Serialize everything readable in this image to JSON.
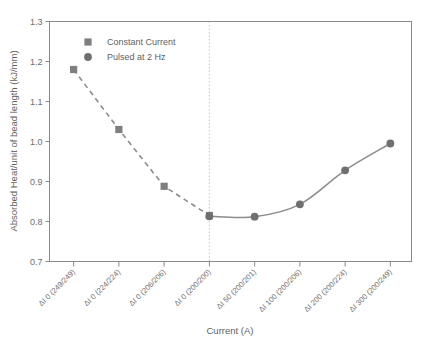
{
  "chart_data": {
    "type": "scatter",
    "title": "",
    "xlabel": "Current (A)",
    "ylabel": "Absorbed Heat/unit of bead length  (kJ/mm)",
    "categories": [
      "ΔI 0 (249/249)",
      "ΔI 0 (224/224)",
      "ΔI 0 (206/206)",
      "ΔI 0 (200/200)",
      "ΔI 50 (200/201)",
      "ΔI 100 (200/206)",
      "ΔI 200 (200/224)",
      "ΔI 300 (200/249)"
    ],
    "ylim": [
      0.7,
      1.3
    ],
    "yticks": [
      "0.7",
      "0.8",
      "0.9",
      "1.0",
      "1.1",
      "1.2",
      "1.3"
    ],
    "ytick_values": [
      0.7,
      0.8,
      0.9,
      1.0,
      1.1,
      1.2,
      1.3
    ],
    "grid": false,
    "legend_position": "top-left-inside",
    "series": [
      {
        "name": "Constant Current",
        "marker": "square",
        "linestyle": "dashed",
        "color": "#7f7f7f",
        "x": [
          0,
          1,
          2,
          3
        ],
        "values": [
          1.18,
          1.03,
          0.888,
          0.815
        ]
      },
      {
        "name": "Pulsed at 2 Hz",
        "marker": "circle",
        "linestyle": "solid",
        "color": "#6f6f6f",
        "x": [
          3,
          4,
          5,
          6,
          7
        ],
        "values": [
          0.813,
          0.812,
          0.843,
          0.928,
          0.995
        ]
      }
    ],
    "annotations": [
      {
        "type": "vertical-divider",
        "at_category_index": 3,
        "style": "dotted",
        "color": "#b9b9b9"
      }
    ]
  },
  "legend": {
    "items": [
      {
        "label": "Constant Current",
        "marker": "square",
        "color": "#7f7f7f"
      },
      {
        "label": "Pulsed at 2 Hz",
        "marker": "circle",
        "color": "#6f6f6f"
      }
    ]
  },
  "axes": {
    "x_title": "Current (A)",
    "y_title": "Absorbed Heat/unit of bead length  (kJ/mm)"
  }
}
